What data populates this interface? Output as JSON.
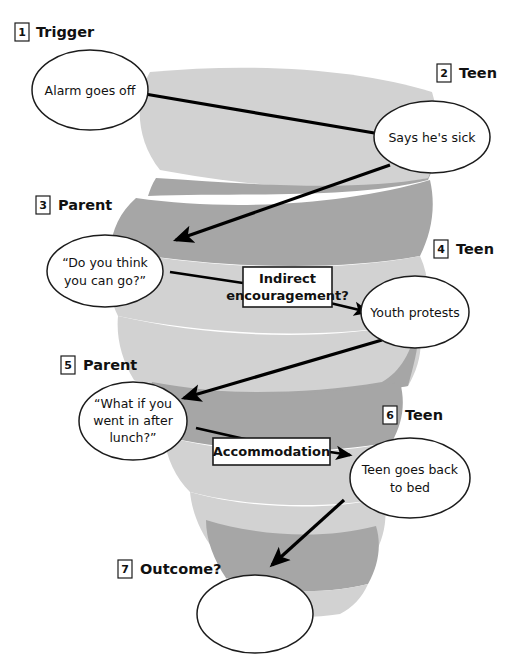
{
  "diagram": {
    "colors": {
      "ribbon_light": "#d2d2d2",
      "ribbon_dark": "#a6a6a6",
      "stroke": "#1c1c1c",
      "background": "#ffffff"
    },
    "steps": [
      {
        "number": "1",
        "label": "Trigger"
      },
      {
        "number": "2",
        "label": "Teen"
      },
      {
        "number": "3",
        "label": "Parent"
      },
      {
        "number": "4",
        "label": "Teen"
      },
      {
        "number": "5",
        "label": "Parent"
      },
      {
        "number": "6",
        "label": "Teen"
      },
      {
        "number": "7",
        "label": "Outcome?"
      }
    ],
    "nodes": [
      {
        "id": "node-1",
        "lines": [
          "Alarm goes off"
        ]
      },
      {
        "id": "node-2",
        "lines": [
          "Says he's sick"
        ]
      },
      {
        "id": "node-3",
        "lines": [
          "“Do you think",
          "you can go?”"
        ]
      },
      {
        "id": "node-4",
        "lines": [
          "Youth protests"
        ]
      },
      {
        "id": "node-5",
        "lines": [
          "“What if you",
          "went in after",
          "lunch?”"
        ]
      },
      {
        "id": "node-6",
        "lines": [
          "Teen goes back",
          "to bed"
        ]
      },
      {
        "id": "node-7",
        "lines": [
          ""
        ]
      }
    ],
    "callouts": [
      {
        "id": "callout-indirect",
        "lines": [
          "Indirect",
          "encouragement?"
        ]
      },
      {
        "id": "callout-accommodation",
        "lines": [
          "Accommodation"
        ]
      }
    ]
  }
}
